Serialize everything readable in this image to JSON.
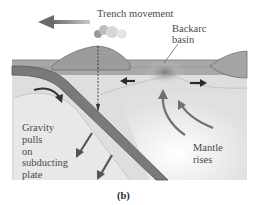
{
  "figure": {
    "caption": "(b)"
  },
  "labels": {
    "trench_movement": "Trench movement",
    "backarc_line1": "Backarc",
    "backarc_line2": "basin",
    "gravity_lines": [
      "Gravity",
      "pulls",
      "on",
      "subducting",
      "plate"
    ],
    "mantle_line1": "Mantle",
    "mantle_line2": "rises"
  },
  "colors": {
    "plate": "#9a9a9a",
    "plate_edge": "#6e6e6e",
    "slab": "#7c7c7c",
    "slab_dark": "#585858",
    "mantle_light": "#e4e4e4",
    "mantle_mid": "#d2d2d2",
    "arrow": "#5c5c5c",
    "text": "#4a4a4a"
  }
}
